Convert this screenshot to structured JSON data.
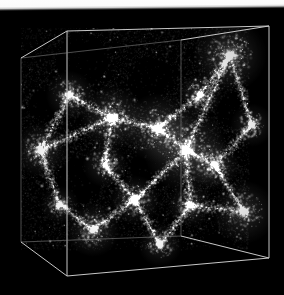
{
  "figure": {
    "kind": "cosmological-n-body-simulation-volume-rendering",
    "caption": "",
    "background_color": "#000000",
    "wire_color": "#d8d8d8",
    "top_band_color": "#fbfbfb",
    "canvas": {
      "width": 284,
      "height": 295
    }
  },
  "top_band": {
    "label": "",
    "height_px": 11,
    "color": "#fbfbfb"
  },
  "cube": {
    "label": "simulation-box",
    "edge_color": "#d2d2d2",
    "edge_width_px": 1,
    "vertices": {
      "back_top_left": [
        21,
        58
      ],
      "back_top_right": [
        181,
        40
      ],
      "front_top_left": [
        67,
        31
      ],
      "front_top_right": [
        269,
        26
      ],
      "back_bottom_left": [
        21,
        242
      ],
      "back_bottom_right": [
        181,
        236
      ],
      "front_bottom_left": [
        67,
        276
      ],
      "front_bottom_right": [
        269,
        258
      ]
    },
    "visible_edges": [
      "front_top_left-front_top_right",
      "front_top_right-front_bottom_right",
      "front_bottom_right-front_bottom_left",
      "front_bottom_left-front_top_left",
      "back_top_left-back_top_right",
      "back_top_left-back_bottom_left",
      "back_bottom_left-back_bottom_right",
      "back_top_left-front_top_left",
      "back_bottom_left-front_bottom_left",
      "back_top_right-front_top_right",
      "back_bottom_right-front_bottom_right",
      "back_top_right-back_bottom_right"
    ]
  },
  "chart_data": {
    "type": "scatter",
    "title": "",
    "xlabel": "",
    "ylabel": "",
    "projection": "3d-perspective-cube",
    "colormap": "grayscale",
    "point_color": "#ffffff",
    "particle_count": 26000,
    "filament_count": 34,
    "void_count": 16,
    "bright_nodes": [
      {
        "x": 230,
        "y": 55,
        "radius": 15,
        "intensity": 1.0
      },
      {
        "x": 186,
        "y": 150,
        "radius": 17,
        "intensity": 0.98
      },
      {
        "x": 158,
        "y": 128,
        "radius": 14,
        "intensity": 0.92
      },
      {
        "x": 112,
        "y": 118,
        "radius": 13,
        "intensity": 0.88
      },
      {
        "x": 244,
        "y": 212,
        "radius": 13,
        "intensity": 0.86
      },
      {
        "x": 93,
        "y": 230,
        "radius": 11,
        "intensity": 0.8
      },
      {
        "x": 40,
        "y": 150,
        "radius": 11,
        "intensity": 0.82
      },
      {
        "x": 215,
        "y": 165,
        "radius": 10,
        "intensity": 0.78
      },
      {
        "x": 135,
        "y": 200,
        "radius": 10,
        "intensity": 0.74
      },
      {
        "x": 70,
        "y": 95,
        "radius": 10,
        "intensity": 0.76
      },
      {
        "x": 200,
        "y": 95,
        "radius": 9,
        "intensity": 0.72
      },
      {
        "x": 160,
        "y": 245,
        "radius": 9,
        "intensity": 0.66
      },
      {
        "x": 252,
        "y": 125,
        "radius": 9,
        "intensity": 0.7
      },
      {
        "x": 105,
        "y": 165,
        "radius": 9,
        "intensity": 0.68
      },
      {
        "x": 60,
        "y": 205,
        "radius": 8,
        "intensity": 0.62
      },
      {
        "x": 190,
        "y": 205,
        "radius": 9,
        "intensity": 0.7
      }
    ],
    "filaments": [
      {
        "from": [
          40,
          150
        ],
        "to": [
          112,
          118
        ]
      },
      {
        "from": [
          112,
          118
        ],
        "to": [
          158,
          128
        ]
      },
      {
        "from": [
          158,
          128
        ],
        "to": [
          186,
          150
        ]
      },
      {
        "from": [
          186,
          150
        ],
        "to": [
          230,
          55
        ]
      },
      {
        "from": [
          186,
          150
        ],
        "to": [
          215,
          165
        ]
      },
      {
        "from": [
          215,
          165
        ],
        "to": [
          244,
          212
        ]
      },
      {
        "from": [
          186,
          150
        ],
        "to": [
          190,
          205
        ]
      },
      {
        "from": [
          190,
          205
        ],
        "to": [
          160,
          245
        ]
      },
      {
        "from": [
          135,
          200
        ],
        "to": [
          186,
          150
        ]
      },
      {
        "from": [
          93,
          230
        ],
        "to": [
          135,
          200
        ]
      },
      {
        "from": [
          60,
          205
        ],
        "to": [
          93,
          230
        ]
      },
      {
        "from": [
          40,
          150
        ],
        "to": [
          60,
          205
        ]
      },
      {
        "from": [
          70,
          95
        ],
        "to": [
          112,
          118
        ]
      },
      {
        "from": [
          70,
          95
        ],
        "to": [
          40,
          150
        ]
      },
      {
        "from": [
          200,
          95
        ],
        "to": [
          230,
          55
        ]
      },
      {
        "from": [
          200,
          95
        ],
        "to": [
          158,
          128
        ]
      },
      {
        "from": [
          252,
          125
        ],
        "to": [
          230,
          55
        ]
      },
      {
        "from": [
          252,
          125
        ],
        "to": [
          215,
          165
        ]
      },
      {
        "from": [
          105,
          165
        ],
        "to": [
          135,
          200
        ]
      },
      {
        "from": [
          105,
          165
        ],
        "to": [
          112,
          118
        ]
      },
      {
        "from": [
          244,
          212
        ],
        "to": [
          190,
          205
        ]
      },
      {
        "from": [
          160,
          245
        ],
        "to": [
          135,
          200
        ]
      }
    ],
    "voids": [
      {
        "x": 82,
        "y": 60,
        "radius": 26
      },
      {
        "x": 150,
        "y": 80,
        "radius": 22
      },
      {
        "x": 236,
        "y": 110,
        "radius": 18
      },
      {
        "x": 80,
        "y": 180,
        "radius": 22
      },
      {
        "x": 150,
        "y": 170,
        "radius": 20
      },
      {
        "x": 215,
        "y": 255,
        "radius": 20
      },
      {
        "x": 120,
        "y": 255,
        "radius": 18
      },
      {
        "x": 45,
        "y": 105,
        "radius": 16
      }
    ],
    "grid": false,
    "legend": null,
    "xlim": [
      0,
      249
    ],
    "ylim": [
      0,
      250
    ]
  }
}
